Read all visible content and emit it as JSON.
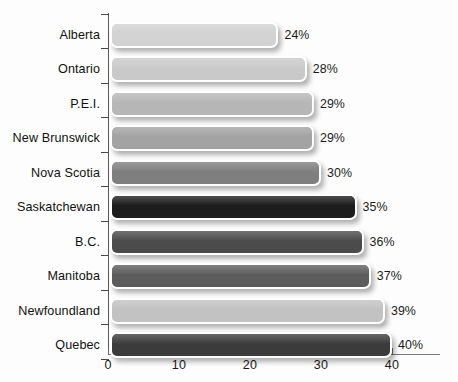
{
  "chart_data": {
    "type": "bar",
    "orientation": "horizontal",
    "title": "",
    "subtitle": "",
    "xlabel": "",
    "ylabel": "",
    "xlim": [
      0,
      40
    ],
    "xticks": [
      0,
      10,
      20,
      30,
      40
    ],
    "xtick_labels": [
      "0",
      "10",
      "20",
      "30",
      "40"
    ],
    "grid": false,
    "legend": false,
    "categories": [
      "Alberta",
      "Ontario",
      "P.E.I.",
      "New Brunswick",
      "Nova Scotia",
      "Saskatchewan",
      "B.C.",
      "Manitoba",
      "Newfoundland",
      "Quebec"
    ],
    "values": [
      24,
      28,
      29,
      29,
      30,
      35,
      36,
      37,
      39,
      40
    ],
    "value_labels": [
      "24%",
      "28%",
      "29%",
      "29%",
      "30%",
      "35%",
      "36%",
      "37%",
      "39%",
      "40%"
    ],
    "bar_colors": [
      "#d2d2d2",
      "#c9c9c9",
      "#b6b6b6",
      "#a2a2a2",
      "#7f7f7f",
      "#1c1c1c",
      "#4b4b4b",
      "#5c5c5c",
      "#c2c2c2",
      "#3b3b3b"
    ]
  }
}
